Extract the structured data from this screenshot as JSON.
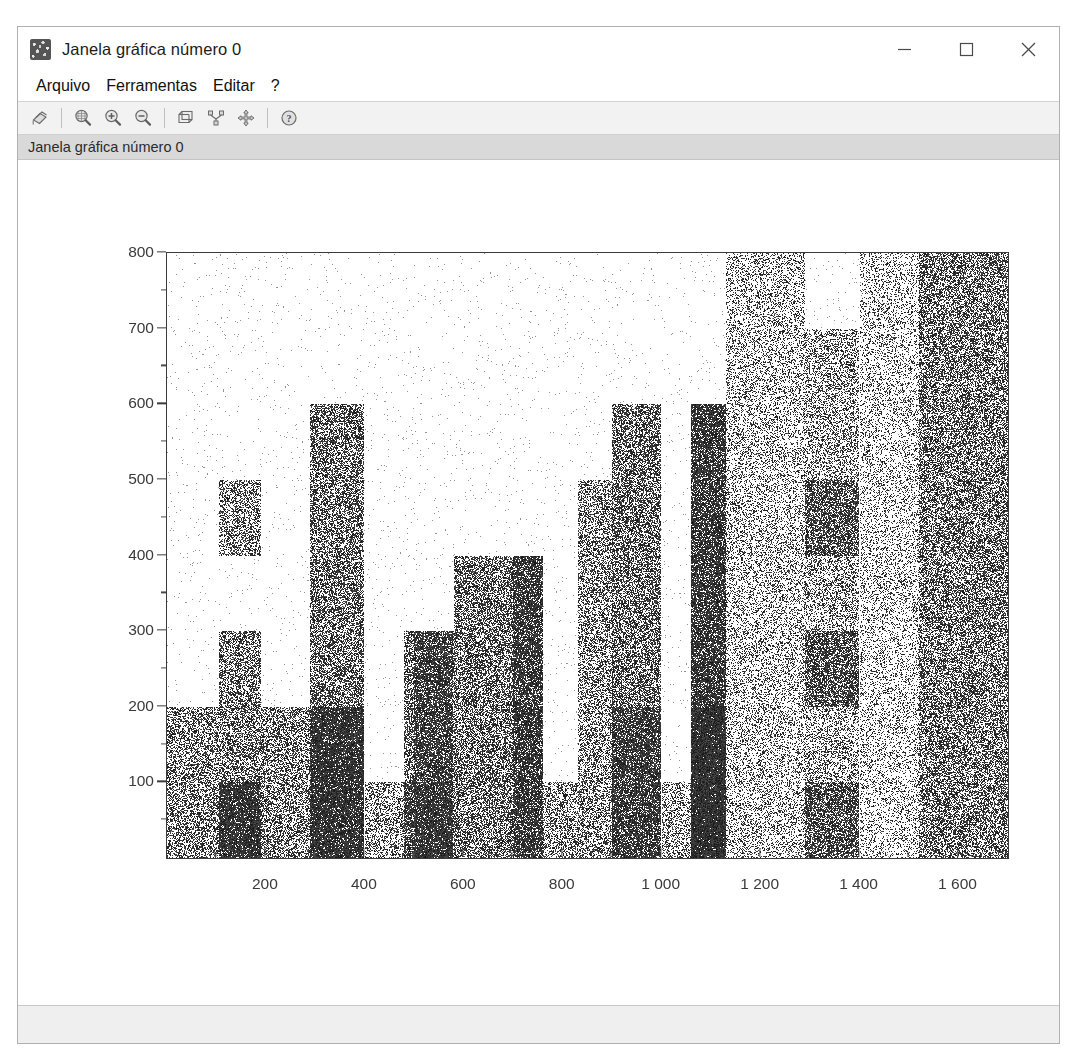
{
  "window": {
    "title": "Janela gráfica número 0",
    "icon": "scilab-graphic-window-icon",
    "controls": {
      "minimize": "−",
      "maximize": "□",
      "close": "×"
    }
  },
  "menubar": {
    "items": [
      {
        "label": "Arquivo",
        "name": "menu-arquivo"
      },
      {
        "label": "Ferramentas",
        "name": "menu-ferramentas"
      },
      {
        "label": "Editar",
        "name": "menu-editar"
      },
      {
        "label": "?",
        "name": "menu-help"
      }
    ]
  },
  "toolbar": {
    "buttons": [
      {
        "name": "export-icon",
        "title": "Exportar"
      },
      {
        "name": "zoom-box-icon",
        "title": "Zoom área"
      },
      {
        "name": "zoom-in-icon",
        "title": "Ampliar"
      },
      {
        "name": "zoom-out-icon",
        "title": "Reduzir"
      },
      {
        "name": "rotate-3d-icon",
        "title": "Rotação 3D"
      },
      {
        "name": "datatip-icon",
        "title": "Dica de dados"
      },
      {
        "name": "pan-move-icon",
        "title": "Mover"
      },
      {
        "name": "help-icon",
        "title": "Ajuda"
      }
    ]
  },
  "infobar": {
    "text": "Janela gráfica número 0"
  },
  "statusbar": {
    "text": ""
  },
  "chart_data": {
    "type": "bar",
    "title": "",
    "xlabel": "",
    "ylabel": "",
    "xlim": [
      0,
      1700
    ],
    "ylim": [
      0,
      800
    ],
    "grid": false,
    "legend": null,
    "style": "dithered-grayscale-bars",
    "xticks": [
      200,
      400,
      600,
      800,
      1000,
      1200,
      1400,
      1600
    ],
    "xtick_labels": [
      "200",
      "400",
      "600",
      "800",
      "1 000",
      "1 200",
      "1 400",
      "1 600"
    ],
    "xticks_minor": [
      100,
      300,
      500,
      700,
      900,
      1100,
      1300,
      1500
    ],
    "yticks": [
      100,
      200,
      300,
      400,
      500,
      600,
      700,
      800
    ],
    "ytick_labels": [
      "100",
      "200",
      "300",
      "400",
      "500",
      "600",
      "700",
      "800"
    ],
    "yticks_minor": [
      50,
      150,
      250,
      350,
      450,
      550,
      650,
      750
    ],
    "bars": [
      {
        "x0": 0,
        "x1": 105,
        "value": 200,
        "gray": "#808080"
      },
      {
        "x0": 105,
        "x1": 190,
        "value": 300,
        "gray": "#7a7a7a"
      },
      {
        "x0": 105,
        "x1": 190,
        "value": 500,
        "gray": "#8d8d8d",
        "segment_from": 400
      },
      {
        "x0": 105,
        "x1": 190,
        "value": 100,
        "gray": "#3a3a3a"
      },
      {
        "x0": 190,
        "x1": 290,
        "value": 200,
        "gray": "#7d7d7d"
      },
      {
        "x0": 290,
        "x1": 400,
        "value": 600,
        "gray": "#6e6e6e"
      },
      {
        "x0": 290,
        "x1": 400,
        "value": 200,
        "gray": "#3c3c3c"
      },
      {
        "x0": 400,
        "x1": 480,
        "value": 100,
        "gray": "#9a9a9a"
      },
      {
        "x0": 480,
        "x1": 580,
        "value": 300,
        "gray": "#6a6a6a"
      },
      {
        "x0": 480,
        "x1": 580,
        "value": 100,
        "gray": "#828282"
      },
      {
        "x0": 580,
        "x1": 700,
        "value": 400,
        "gray": "#6d6d6d"
      },
      {
        "x0": 500,
        "x1": 580,
        "value": 300,
        "gray": "#777777"
      },
      {
        "x0": 700,
        "x1": 760,
        "value": 400,
        "gray": "#2f2f2f"
      },
      {
        "x0": 760,
        "x1": 830,
        "value": 100,
        "gray": "#8e8e8e"
      },
      {
        "x0": 830,
        "x1": 900,
        "value": 500,
        "gray": "#8a8a8a"
      },
      {
        "x0": 900,
        "x1": 1000,
        "value": 600,
        "gray": "#6b6b6b"
      },
      {
        "x0": 900,
        "x1": 1000,
        "value": 200,
        "gray": "#707070"
      },
      {
        "x0": 1000,
        "x1": 1060,
        "value": 100,
        "gray": "#9b9b9b"
      },
      {
        "x0": 1060,
        "x1": 1130,
        "value": 600,
        "gray": "#2d2d2d"
      },
      {
        "x0": 1060,
        "x1": 1130,
        "value": 200,
        "gray": "#2d2d2d"
      },
      {
        "x0": 1130,
        "x1": 1290,
        "value": 800,
        "gray": "#b4b4b4"
      },
      {
        "x0": 1290,
        "x1": 1400,
        "value": 700,
        "gray": "#9f9f9f"
      },
      {
        "x0": 1290,
        "x1": 1400,
        "value": 500,
        "gray": "#7c7c7c",
        "segment_from": 400
      },
      {
        "x0": 1290,
        "x1": 1400,
        "value": 300,
        "gray": "#7a7a7a",
        "segment_from": 200
      },
      {
        "x0": 1290,
        "x1": 1400,
        "value": 100,
        "gray": "#787878"
      },
      {
        "x0": 1400,
        "x1": 1520,
        "value": 800,
        "gray": "#c2c2c2"
      },
      {
        "x0": 1520,
        "x1": 1700,
        "value": 800,
        "gray": "#717171"
      }
    ]
  }
}
